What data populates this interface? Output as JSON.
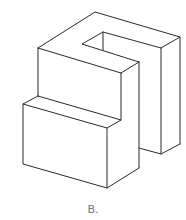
{
  "figure": {
    "stroke_color": "#2a2a2a",
    "background": "#ffffff"
  },
  "caption": {
    "label": "B.",
    "color": "#777777"
  }
}
